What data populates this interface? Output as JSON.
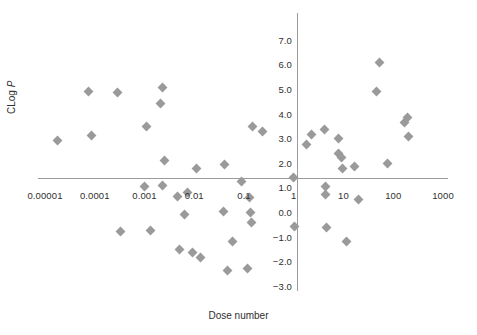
{
  "chart_data": {
    "type": "scatter",
    "title": "",
    "xlabel": "Dose number",
    "ylabel": "CLog P",
    "ylabel_prefix": "CLog ",
    "ylabel_italic": "P",
    "xscale": "log",
    "yscale": "linear",
    "xlim": [
      1e-05,
      1000
    ],
    "ylim": [
      -3.0,
      7.0
    ],
    "grid": false,
    "legend": null,
    "marker": "diamond",
    "marker_color": "#9a9a9a",
    "axis_color": "#9b9b9b",
    "xticks": [
      {
        "value": 1e-05,
        "label": "0.00001"
      },
      {
        "value": 0.0001,
        "label": "0.0001"
      },
      {
        "value": 0.001,
        "label": "0.001"
      },
      {
        "value": 0.01,
        "label": "0.01"
      },
      {
        "value": 0.1,
        "label": "0.1"
      },
      {
        "value": 1,
        "label": "1"
      },
      {
        "value": 10,
        "label": "10"
      },
      {
        "value": 100,
        "label": "100"
      },
      {
        "value": 1000,
        "label": "1000"
      }
    ],
    "yticks": [
      {
        "value": 7.0,
        "label": "7.0"
      },
      {
        "value": 6.0,
        "label": "6.0"
      },
      {
        "value": 5.0,
        "label": "5.0"
      },
      {
        "value": 4.0,
        "label": "4.0"
      },
      {
        "value": 3.0,
        "label": "3.0"
      },
      {
        "value": 2.0,
        "label": "2.0"
      },
      {
        "value": 1.0,
        "label": "1.0"
      },
      {
        "value": 0.0,
        "label": "0.0"
      },
      {
        "value": -1.0,
        "label": "−1.0"
      },
      {
        "value": -2.0,
        "label": "−2.0"
      },
      {
        "value": -3.0,
        "label": "−3.0"
      }
    ],
    "points": [
      {
        "x": 1.8e-05,
        "y": 2.9
      },
      {
        "x": 7.5e-05,
        "y": 4.88
      },
      {
        "x": 8.5e-05,
        "y": 3.12
      },
      {
        "x": 0.00029,
        "y": 4.85
      },
      {
        "x": 0.00033,
        "y": -0.8
      },
      {
        "x": 0.00098,
        "y": 1.05
      },
      {
        "x": 0.0011,
        "y": 3.48
      },
      {
        "x": 0.00135,
        "y": -0.75
      },
      {
        "x": 0.0021,
        "y": 4.42
      },
      {
        "x": 0.00225,
        "y": 5.05
      },
      {
        "x": 0.00235,
        "y": 1.06
      },
      {
        "x": 0.0025,
        "y": 2.1
      },
      {
        "x": 0.0047,
        "y": 0.62
      },
      {
        "x": 0.0051,
        "y": -1.52
      },
      {
        "x": 0.0065,
        "y": -0.1
      },
      {
        "x": 0.0072,
        "y": 0.78
      },
      {
        "x": 0.0092,
        "y": -1.63
      },
      {
        "x": 0.011,
        "y": 1.78
      },
      {
        "x": 0.0135,
        "y": -1.86
      },
      {
        "x": 0.038,
        "y": 0.02
      },
      {
        "x": 0.04,
        "y": 1.92
      },
      {
        "x": 0.047,
        "y": -2.36
      },
      {
        "x": 0.058,
        "y": -1.18
      },
      {
        "x": 0.09,
        "y": 1.22
      },
      {
        "x": 0.12,
        "y": -2.3
      },
      {
        "x": 0.13,
        "y": 0.58
      },
      {
        "x": 0.135,
        "y": -0.02
      },
      {
        "x": 0.14,
        "y": -0.42
      },
      {
        "x": 0.15,
        "y": 3.47
      },
      {
        "x": 0.23,
        "y": 3.28
      },
      {
        "x": 1.0,
        "y": 1.42
      },
      {
        "x": 1.05,
        "y": -0.6
      },
      {
        "x": 1.8,
        "y": 2.75
      },
      {
        "x": 2.3,
        "y": 3.15
      },
      {
        "x": 4.2,
        "y": 3.37
      },
      {
        "x": 4.3,
        "y": 1.05
      },
      {
        "x": 4.35,
        "y": 0.72
      },
      {
        "x": 4.6,
        "y": -0.65
      },
      {
        "x": 7.8,
        "y": 2.38
      },
      {
        "x": 8.1,
        "y": 2.97
      },
      {
        "x": 9.0,
        "y": 2.23
      },
      {
        "x": 9.5,
        "y": 1.76
      },
      {
        "x": 11.5,
        "y": -1.18
      },
      {
        "x": 17.0,
        "y": 1.87
      },
      {
        "x": 20.0,
        "y": 0.52
      },
      {
        "x": 45.0,
        "y": 4.9
      },
      {
        "x": 52.0,
        "y": 6.07
      },
      {
        "x": 78.0,
        "y": 1.97
      },
      {
        "x": 165.0,
        "y": 3.62
      },
      {
        "x": 195.0,
        "y": 3.85
      },
      {
        "x": 205.0,
        "y": 3.05
      }
    ]
  }
}
